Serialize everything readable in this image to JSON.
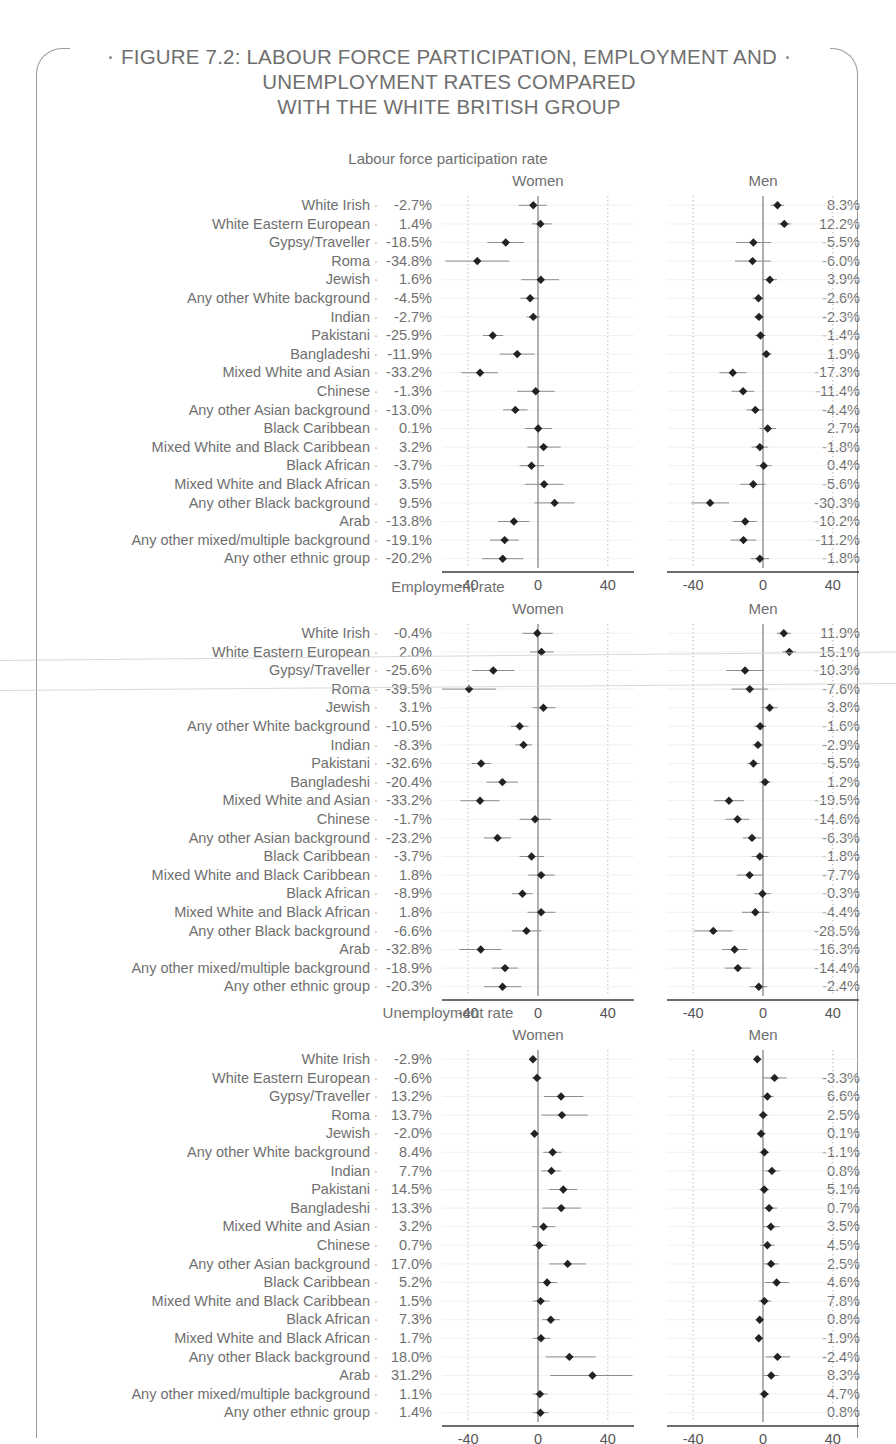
{
  "figure": {
    "title_line1": "FIGURE 7.2: LABOUR FORCE PARTICIPATION, EMPLOYMENT AND",
    "title_line2": "UNEMPLOYMENT RATES COMPARED",
    "title_line3": "WITH THE WHITE BRITISH GROUP"
  },
  "axis": {
    "ticks": [
      "-40",
      "0",
      "40"
    ],
    "tick_values": [
      -40,
      0,
      40
    ],
    "xmin": -55,
    "xmax": 55
  },
  "groups": [
    "White Irish",
    "White Eastern European",
    "Gypsy/Traveller",
    "Roma",
    "Jewish",
    "Any other White background",
    "Indian",
    "Pakistani",
    "Bangladeshi",
    "Mixed White and Asian",
    "Chinese",
    "Any other Asian background",
    "Black Caribbean",
    "Mixed White and Black Caribbean",
    "Black African",
    "Mixed White and Black African",
    "Any other Black background",
    "Arab",
    "Any other mixed/multiple background",
    "Any other ethnic group"
  ],
  "chart_data": {
    "type": "scatter",
    "title": "FIGURE 7.2: LABOUR FORCE PARTICIPATION, EMPLOYMENT AND UNEMPLOYMENT RATES COMPARED WITH THE WHITE BRITISH GROUP",
    "xlabel": "",
    "ylabel": "",
    "xlim": [
      -55,
      55
    ],
    "xticks": [
      -40,
      0,
      40
    ],
    "grid": "dotted vertical reference lines at -40 and 40; solid zero line",
    "legend": "none",
    "categories": [
      "White Irish",
      "White Eastern European",
      "Gypsy/Traveller",
      "Roma",
      "Jewish",
      "Any other White background",
      "Indian",
      "Pakistani",
      "Bangladeshi",
      "Mixed White and Asian",
      "Chinese",
      "Any other Asian background",
      "Black Caribbean",
      "Mixed White and Black Caribbean",
      "Black African",
      "Mixed White and Black African",
      "Any other Black background",
      "Arab",
      "Any other mixed/multiple background",
      "Any other ethnic group"
    ],
    "panels": [
      {
        "name": "Labour force participation rate",
        "subpanels": [
          {
            "name": "Women",
            "labels": [
              "-2.7%",
              "1.4%",
              "-18.5%",
              "-34.8%",
              "1.6%",
              "-4.5%",
              "-2.7%",
              "-25.9%",
              "-11.9%",
              "-33.2%",
              "-1.3%",
              "-13.0%",
              "0.1%",
              "3.2%",
              "-3.7%",
              "3.5%",
              "9.5%",
              "-13.8%",
              "-19.1%",
              "-20.2%"
            ],
            "values": [
              -2.7,
              1.4,
              -18.5,
              -34.8,
              1.6,
              -4.5,
              -2.7,
              -25.9,
              -11.9,
              -33.2,
              -1.3,
              -13.0,
              0.1,
              3.2,
              -3.7,
              3.5,
              9.5,
              -13.8,
              -19.1,
              -20.2
            ],
            "ci_low": [
              -11.0,
              -3.5,
              -29.0,
              -53.0,
              -9.5,
              -10.0,
              -6.5,
              -31.5,
              -22.0,
              -44.0,
              -12.0,
              -20.0,
              -7.5,
              -6.0,
              -10.5,
              -7.5,
              -2.0,
              -23.0,
              -27.5,
              -32.0
            ],
            "ci_high": [
              5.0,
              8.0,
              -8.0,
              -16.5,
              12.0,
              0.5,
              1.0,
              -20.0,
              -2.0,
              -23.0,
              9.5,
              -6.0,
              8.0,
              13.0,
              3.5,
              14.5,
              21.0,
              -5.0,
              -11.0,
              -8.5
            ]
          },
          {
            "name": "Men",
            "labels": [
              "8.3%",
              "12.2%",
              "-5.5%",
              "-6.0%",
              "3.9%",
              "-2.6%",
              "-2.3%",
              "-1.4%",
              "1.9%",
              "-17.3%",
              "-11.4%",
              "-4.4%",
              "2.7%",
              "-1.8%",
              "0.4%",
              "-5.6%",
              "-30.3%",
              "-10.2%",
              "-11.2%",
              "-1.8%"
            ],
            "values": [
              8.3,
              12.2,
              -5.5,
              -6.0,
              3.9,
              -2.6,
              -2.3,
              -1.4,
              1.9,
              -17.3,
              -11.4,
              -4.4,
              2.7,
              -1.8,
              0.4,
              -5.6,
              -30.3,
              -10.2,
              -11.2,
              -1.8
            ],
            "ci_low": [
              4.5,
              8.5,
              -15.5,
              -16.0,
              -0.5,
              -6.0,
              -5.0,
              -4.5,
              -1.0,
              -25.0,
              -18.0,
              -9.5,
              -2.0,
              -6.5,
              -4.0,
              -13.0,
              -41.0,
              -17.0,
              -18.5,
              -7.0
            ],
            "ci_high": [
              12.0,
              16.0,
              4.5,
              4.5,
              8.0,
              0.5,
              0.5,
              1.5,
              5.0,
              -9.5,
              -5.0,
              0.5,
              7.5,
              3.0,
              5.0,
              1.5,
              -19.5,
              -3.5,
              -4.0,
              3.5
            ]
          }
        ]
      },
      {
        "name": "Employment rate",
        "subpanels": [
          {
            "name": "Women",
            "labels": [
              "-0.4%",
              "2.0%",
              "-25.6%",
              "-39.5%",
              "3.1%",
              "-10.5%",
              "-8.3%",
              "-32.6%",
              "-20.4%",
              "-33.2%",
              "-1.7%",
              "-23.2%",
              "-3.7%",
              "1.8%",
              "-8.9%",
              "1.8%",
              "-6.6%",
              "-32.8%",
              "-18.9%",
              "-20.3%"
            ],
            "values": [
              -0.4,
              2.0,
              -25.6,
              -39.5,
              3.1,
              -10.5,
              -8.3,
              -32.6,
              -20.4,
              -33.2,
              -1.7,
              -23.2,
              -3.7,
              1.8,
              -8.9,
              1.8,
              -6.6,
              -32.8,
              -18.9,
              -20.3
            ],
            "ci_low": [
              -9.0,
              -4.5,
              -37.5,
              -55.0,
              -3.0,
              -15.5,
              -13.0,
              -38.0,
              -29.5,
              -44.5,
              -10.5,
              -31.0,
              -10.5,
              -5.5,
              -15.0,
              -6.0,
              -15.0,
              -45.0,
              -26.5,
              -31.0
            ],
            "ci_high": [
              8.5,
              9.0,
              -13.5,
              -24.0,
              10.0,
              -5.5,
              -3.5,
              -27.0,
              -11.5,
              -22.0,
              7.5,
              -15.5,
              3.5,
              9.5,
              -3.0,
              10.0,
              2.0,
              -21.0,
              -11.5,
              -9.5
            ]
          },
          {
            "name": "Men",
            "labels": [
              "11.9%",
              "15.1%",
              "-10.3%",
              "-7.6%",
              "3.8%",
              "-1.6%",
              "-2.9%",
              "-5.5%",
              "1.2%",
              "-19.5%",
              "-14.6%",
              "-6.3%",
              "-1.8%",
              "-7.7%",
              "-0.3%",
              "-4.4%",
              "-28.5%",
              "-16.3%",
              "-14.4%",
              "-2.4%"
            ],
            "values": [
              11.9,
              15.1,
              -10.3,
              -7.6,
              3.8,
              -1.6,
              -2.9,
              -5.5,
              1.2,
              -19.5,
              -14.6,
              -6.3,
              -1.8,
              -7.7,
              -0.3,
              -4.4,
              -28.5,
              -16.3,
              -14.4,
              -2.4
            ],
            "ci_low": [
              8.0,
              11.0,
              -21.0,
              -18.0,
              -1.0,
              -5.0,
              -6.0,
              -9.0,
              -2.0,
              -28.0,
              -21.5,
              -11.5,
              -6.5,
              -15.0,
              -5.0,
              -12.0,
              -39.5,
              -23.5,
              -22.0,
              -7.5
            ],
            "ci_high": [
              16.0,
              19.0,
              0.5,
              3.0,
              8.5,
              2.0,
              0.0,
              -2.0,
              4.5,
              -11.0,
              -8.0,
              -1.0,
              3.0,
              -0.5,
              4.5,
              3.5,
              -17.5,
              -9.0,
              -7.0,
              2.5
            ]
          }
        ]
      },
      {
        "name": "Unemployment rate",
        "subpanels": [
          {
            "name": "Women",
            "labels": [
              "-2.9%",
              "-0.6%",
              "13.2%",
              "13.7%",
              "-2.0%",
              "8.4%",
              "7.7%",
              "14.5%",
              "13.3%",
              "3.2%",
              "0.7%",
              "17.0%",
              "5.2%",
              "1.5%",
              "7.3%",
              "1.7%",
              "18.0%",
              "31.2%",
              "1.1%",
              "1.4%"
            ],
            "values": [
              -2.9,
              -0.6,
              13.2,
              13.7,
              -2.0,
              8.4,
              7.7,
              14.5,
              13.3,
              3.2,
              0.7,
              17.0,
              5.2,
              1.5,
              7.3,
              1.7,
              18.0,
              31.2,
              1.1,
              1.4
            ],
            "ci_low": [
              -5.0,
              -3.5,
              3.5,
              2.0,
              -4.5,
              3.0,
              2.0,
              6.5,
              2.5,
              -3.5,
              -3.0,
              6.5,
              -0.5,
              -3.0,
              2.5,
              -3.0,
              4.5,
              7.0,
              -3.0,
              -3.0
            ],
            "ci_high": [
              -0.5,
              2.0,
              26.0,
              28.5,
              0.5,
              13.5,
              13.0,
              22.5,
              24.5,
              10.0,
              5.0,
              27.5,
              11.0,
              6.5,
              12.5,
              7.0,
              33.0,
              54.0,
              5.5,
              6.0
            ]
          },
          {
            "name": "Men",
            "labels": [
              "-3.3%",
              "6.6%",
              "2.5%",
              "0.1%",
              "-1.1%",
              "0.8%",
              "5.1%",
              "0.7%",
              "3.5%",
              "4.5%",
              "2.5%",
              "4.6%",
              "7.8%",
              "0.8%",
              "-1.9%",
              "-2.4%",
              "8.3%",
              "4.7%",
              "0.8%"
            ],
            "values": [
              -3.3,
              6.6,
              2.5,
              0.1,
              -1.1,
              0.8,
              5.1,
              0.7,
              3.5,
              4.5,
              2.5,
              4.6,
              7.8,
              0.8,
              -1.9,
              -2.4,
              8.3,
              4.7,
              0.8
            ],
            "ci_low": [
              -5.5,
              0.0,
              -1.0,
              -2.5,
              -3.5,
              -2.0,
              1.0,
              -2.0,
              -0.5,
              0.0,
              -1.5,
              0.5,
              1.0,
              -2.5,
              -4.0,
              -4.5,
              1.5,
              0.5,
              -2.0
            ],
            "ci_high": [
              -1.0,
              13.5,
              6.0,
              3.0,
              1.5,
              3.5,
              9.5,
              3.5,
              8.0,
              9.5,
              6.5,
              9.0,
              15.0,
              4.5,
              0.5,
              -0.5,
              15.5,
              9.0,
              3.5
            ]
          }
        ]
      }
    ]
  }
}
